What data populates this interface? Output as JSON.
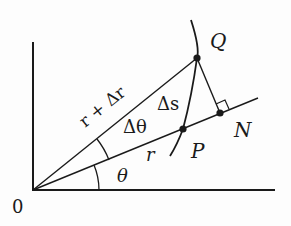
{
  "diagram": {
    "colors": {
      "ink": "#1a1a1a",
      "background": "#fdfdfd"
    },
    "labels": {
      "origin": "0",
      "Q": "Q",
      "P": "P",
      "N": "N",
      "delta_s": "Δs",
      "delta_theta": "Δθ",
      "theta": "θ",
      "r": "r",
      "r_plus_delta_r": "r + Δr"
    },
    "points": {
      "O": [
        33,
        190
      ],
      "Q": [
        197,
        58
      ],
      "P": [
        183,
        129
      ],
      "N": [
        220,
        113
      ]
    },
    "elements": [
      "x-axis",
      "y-axis",
      "ray OQ labeled r + Δr",
      "ray OP (extended past N) labeled r",
      "curve through Q and P",
      "segment QN perpendicular to OP with right-angle marker",
      "angle arc θ between x-axis and OP",
      "angle arc Δθ between OP and OQ"
    ]
  }
}
